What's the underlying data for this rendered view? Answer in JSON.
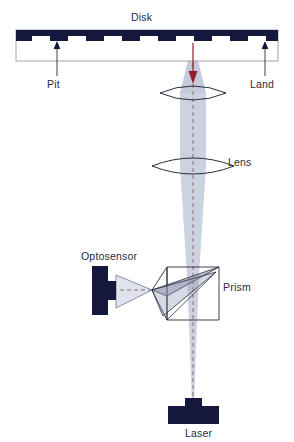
{
  "diagram": {
    "labels": {
      "disk": "Disk",
      "pit": "Pit",
      "land": "Land",
      "lens": "Lens",
      "optosensor": "Optosensor",
      "prism": "Prism",
      "laser": "Laser"
    },
    "colors": {
      "disk_fill": "#14183c",
      "component_fill": "#14183c",
      "beam_fill": "#b9c0d4",
      "outline": "#2b2b3d",
      "axis_dash": "#8a4a5a",
      "arrow_red": "#8f1f27",
      "box_outline": "#9a9aa8",
      "text": "#2b2b3d",
      "background": "#ffffff"
    },
    "components": [
      {
        "name": "disk",
        "label": "Disk"
      },
      {
        "name": "pit",
        "label": "Pit"
      },
      {
        "name": "land",
        "label": "Land"
      },
      {
        "name": "objective-lens",
        "label": "Lens"
      },
      {
        "name": "collimating-lens",
        "label": "Lens"
      },
      {
        "name": "prism",
        "label": "Prism"
      },
      {
        "name": "optosensor",
        "label": "Optosensor"
      },
      {
        "name": "laser",
        "label": "Laser"
      }
    ],
    "pit_count": 11
  }
}
